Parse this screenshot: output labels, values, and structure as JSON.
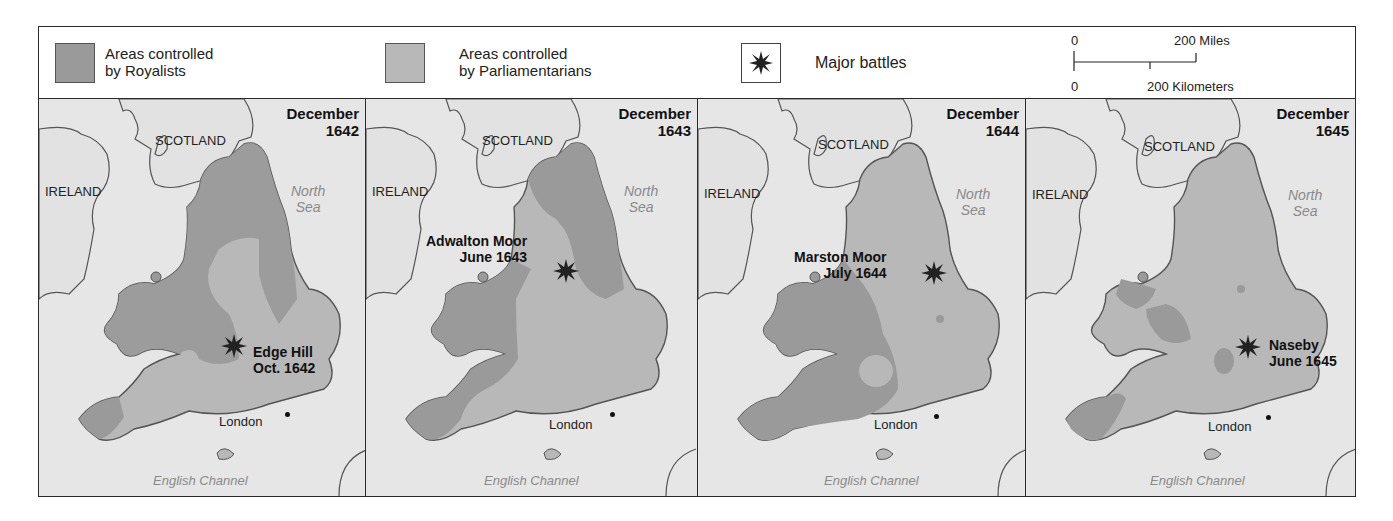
{
  "legend": {
    "royalists": {
      "label_line1": "Areas controlled",
      "label_line2": "by Royalists",
      "color": "#9a9a9a"
    },
    "parliamentarians": {
      "label_line1": "Areas controlled",
      "label_line2": "by Parliamentarians",
      "color": "#b8b8b8"
    },
    "battles": {
      "label": "Major battles",
      "icon": "explosion-star-icon"
    },
    "scale": {
      "miles_zero": "0",
      "miles_label": "200 Miles",
      "km_zero": "0",
      "km_label": "200 Kilometers"
    }
  },
  "colors": {
    "sea": "#e6e6e6",
    "land_neutral": "#e2e2e2",
    "royalist": "#9a9a9a",
    "parliamentarian": "#b8b8b8",
    "border": "#2a2a2a",
    "coast": "#555555"
  },
  "panels": [
    {
      "date_line1": "December",
      "date_line2": "1642",
      "scotland": "SCOTLAND",
      "ireland": "IRELAND",
      "north_sea_line1": "North",
      "north_sea_line2": "Sea",
      "london": "London",
      "channel": "English Channel",
      "battle": {
        "name": "Edge Hill",
        "date": "Oct. 1642"
      }
    },
    {
      "date_line1": "December",
      "date_line2": "1643",
      "scotland": "SCOTLAND",
      "ireland": "IRELAND",
      "north_sea_line1": "North",
      "north_sea_line2": "Sea",
      "london": "London",
      "channel": "English Channel",
      "battle": {
        "name": "Adwalton Moor",
        "date": "June 1643"
      }
    },
    {
      "date_line1": "December",
      "date_line2": "1644",
      "scotland": "SCOTLAND",
      "ireland": "IRELAND",
      "north_sea_line1": "North",
      "north_sea_line2": "Sea",
      "london": "London",
      "channel": "English Channel",
      "battle": {
        "name": "Marston Moor",
        "date": "July 1644"
      }
    },
    {
      "date_line1": "December",
      "date_line2": "1645",
      "scotland": "SCOTLAND",
      "ireland": "IRELAND",
      "north_sea_line1": "North",
      "north_sea_line2": "Sea",
      "london": "London",
      "channel": "English Channel",
      "battle": {
        "name": "Naseby",
        "date": "June 1645"
      }
    }
  ]
}
